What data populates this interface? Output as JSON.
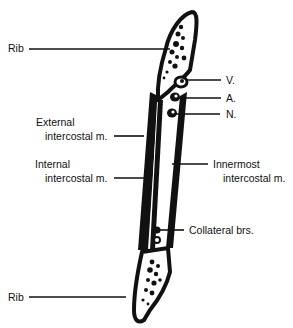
{
  "diagram": {
    "labels": {
      "rib_top": "Rib",
      "vein": "V.",
      "artery": "A.",
      "nerve": "N.",
      "external_line1": "External",
      "external_line2": "intercostal m.",
      "internal_line1": "Internal",
      "internal_line2": "intercostal m.",
      "innermost_line1": "Innermost",
      "innermost_line2": "intercostal m.",
      "collateral": "Collateral brs.",
      "rib_bottom": "Rib"
    },
    "colors": {
      "ink": "#111111",
      "background": "#ffffff"
    }
  }
}
